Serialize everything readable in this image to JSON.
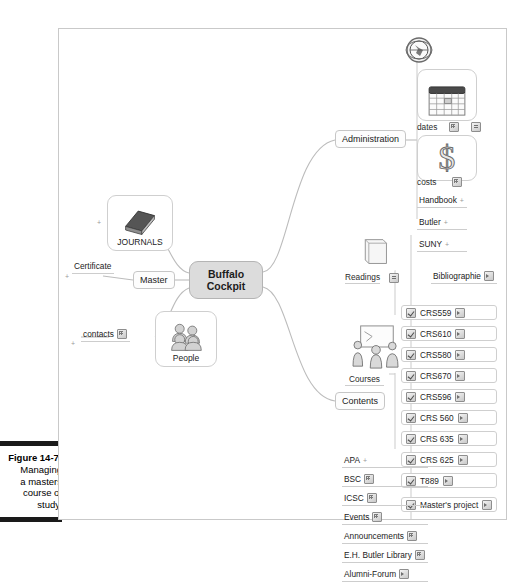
{
  "figure": {
    "number": "Figure 14-7:",
    "caption_lines": [
      "Managing",
      "a masters",
      "course of",
      "study."
    ]
  },
  "mindmap": {
    "central": {
      "line1": "Buffalo",
      "line2": "Cockpit"
    },
    "branches": {
      "administration": {
        "label": "Administration",
        "top_icon": "globe-icon",
        "picture_nodes": [
          {
            "label": "dates",
            "icon": "calendar-icon",
            "chips": [
              "grid-icon",
              "note-icon"
            ]
          },
          {
            "label": "costs",
            "icon": "dollar-icon",
            "chips": [
              "grid-icon"
            ]
          }
        ],
        "leaves": [
          "Handbook",
          "Butler",
          "SUNY"
        ]
      },
      "contents": {
        "label": "Contents",
        "readings": {
          "label": "Readings",
          "icon": "book-icon",
          "chip": "note-icon"
        },
        "bibliographie": {
          "label": "Bibliographie",
          "chip": "speaker-icon"
        },
        "courses": {
          "label": "Courses",
          "icon": "classroom-icon"
        },
        "course_items": [
          "CRS559",
          "CRS610",
          "CRS580",
          "CRS670",
          "CRS596",
          "CRS 560",
          "CRS 635",
          "CRS 625",
          "T889",
          "Master's project"
        ],
        "leaves": [
          {
            "label": "APA",
            "chip": false
          },
          {
            "label": "BSC",
            "chip": true
          },
          {
            "label": "ICSC",
            "chip": true
          },
          {
            "label": "Events",
            "chip": true
          },
          {
            "label": "Announcements",
            "chip": true
          },
          {
            "label": "E.H. Butler Library",
            "chip": true
          },
          {
            "label": "Alumni-Forum",
            "chip": true
          }
        ]
      },
      "journals": {
        "label": "JOURNALS",
        "icon": "book-icon"
      },
      "master": {
        "label": "Master",
        "child": "Certificate"
      },
      "people": {
        "label": "People",
        "icon": "users-icon",
        "child": "contacts"
      }
    }
  },
  "colors": {
    "central_fill": "#dcdcdc",
    "border": "#c9c9c9",
    "text": "#222222",
    "wire": "#b9b9b9"
  }
}
